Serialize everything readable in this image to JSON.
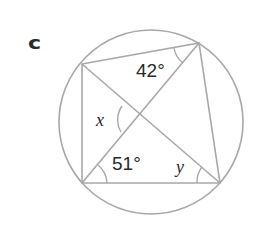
{
  "part_label": "c",
  "angles": {
    "top": "42°",
    "bottom_left": "51°",
    "x_label": "x",
    "y_label": "y"
  },
  "colors": {
    "stroke": "#a8a8a8",
    "text": "#2a2a2a"
  }
}
